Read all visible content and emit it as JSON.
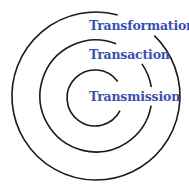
{
  "diagram": {
    "type": "concentric-circles",
    "colors": {
      "ring_stroke": "#1a1a1a",
      "label_text": "#3b4fae",
      "background": "#ffffff"
    },
    "rings": [
      {
        "level": "outer",
        "label": "Transformation"
      },
      {
        "level": "middle",
        "label": "Transaction"
      },
      {
        "level": "inner",
        "label": "Transmission"
      }
    ]
  }
}
